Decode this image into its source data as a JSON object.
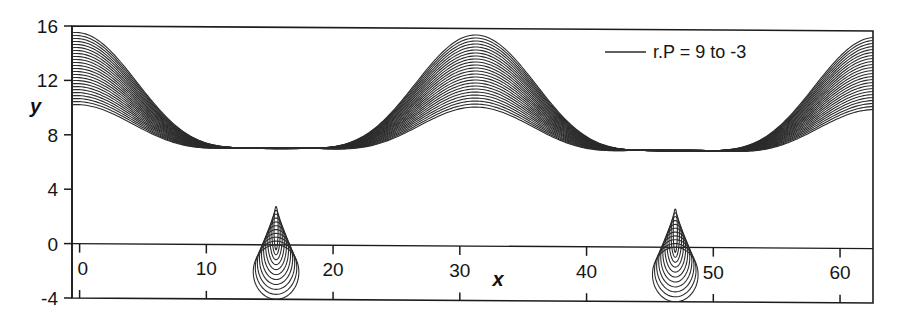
{
  "chart_data": {
    "type": "line",
    "title": "",
    "xlabel": "x",
    "ylabel": "y",
    "xlim": [
      -0.6,
      62.6
    ],
    "ylim": [
      -4,
      16
    ],
    "xticks": [
      0,
      10,
      20,
      30,
      40,
      50,
      60
    ],
    "xtick_labels": [
      "0",
      "10",
      "20",
      "30",
      "40",
      "50",
      "60"
    ],
    "yticks": [
      -4,
      0,
      4,
      8,
      12,
      16
    ],
    "ytick_labels": [
      "-4",
      "0",
      "4",
      "8",
      "12",
      "16"
    ],
    "grid": false,
    "legend_position": "top-right",
    "legend": [
      {
        "label": "r.P = 9 to -3",
        "color": "#2b2b2b"
      }
    ],
    "series_parameter": {
      "name": "r.P",
      "from": 9,
      "to": -3,
      "step": -0.5,
      "count": 25
    },
    "line_color": "#2b2b2b",
    "line_width": 1.1,
    "features": {
      "cusp_x_positions": [
        15.5,
        47.0
      ],
      "cusp_y": 0.0,
      "arch_peak_x": 31.0,
      "arch_peak_y": 13.5,
      "arch_trough_y": 1.7,
      "left_edge_y_range": [
        2.0,
        14.3
      ],
      "right_edge_y_range": [
        2.5,
        13.3
      ],
      "loop_min_y": -4.0,
      "loop_half_width": 1.8,
      "envelope_upper_at_cusp": 7.9,
      "envelope_lower_at_arch_shoulder": 5.2,
      "period": 31.5
    }
  },
  "axes": {
    "y_axis_name": "y-axis",
    "x_axis_name": "x-axis"
  }
}
